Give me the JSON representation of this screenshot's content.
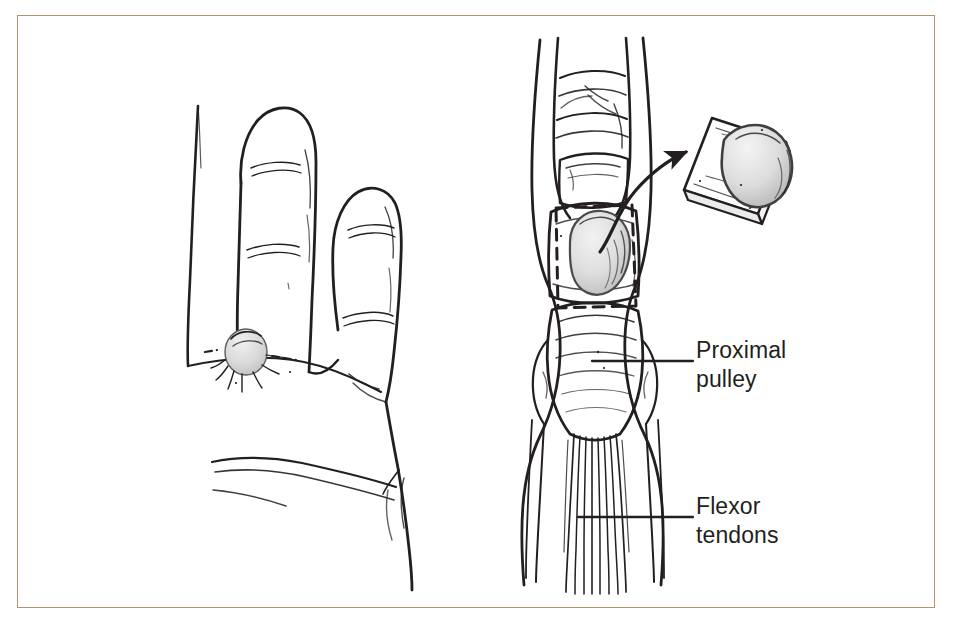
{
  "figure": {
    "domain_kind": "medical-line-illustration",
    "title_visible": false,
    "frame_color": "#b79070",
    "background_color": "#ffffff",
    "ink_color": "#231f20",
    "cyst_fill_color": "#d9d9d9"
  },
  "labels": [
    {
      "id": "proximal-pulley",
      "line1": "Proximal",
      "line2": "pulley",
      "leader_from_x": 592,
      "leader_to_x": 693,
      "leader_y": 361
    },
    {
      "id": "flexor-tendons",
      "line1": "Flexor",
      "line2": "tendons",
      "leader_from_x": 578,
      "leader_to_x": 693,
      "leader_y": 517
    }
  ],
  "panels": {
    "left": {
      "name": "palm-view",
      "description_parts": [
        "index-finger",
        "middle-finger",
        "ring-finger",
        "palm",
        "palmar-crease",
        "retinacular-cyst-nodule"
      ]
    },
    "right": {
      "name": "dissected-finger-view",
      "description_parts": [
        "finger-annular-pulleys",
        "proximal-pulley-band",
        "dashed-excision-outline",
        "cyst-dome",
        "flexor-tendon-bundle",
        "curved-transfer-arrow",
        "excised-specimen-inset"
      ]
    }
  }
}
